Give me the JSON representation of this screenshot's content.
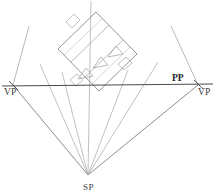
{
  "diagram": {
    "type": "perspective-construction",
    "canvas": {
      "width": 215,
      "height": 196
    },
    "background_color": "#ffffff"
  },
  "labels": {
    "vp_left": "VP",
    "vp_right": "VP",
    "picture_plane": "PP",
    "station_point": "SP",
    "caption": ""
  },
  "colors": {
    "picture_plane_line": "#4a4a4a",
    "sight_line": "#6e6e6e",
    "construction_line": "#9a9a9a",
    "object_outline": "#8a8a8a",
    "object_detail": "#a9a9a9",
    "label_text": "#2b2b2b"
  },
  "points": {
    "vp_left": {
      "x": 13,
      "y": 85
    },
    "vp_right": {
      "x": 198,
      "y": 85
    },
    "station_point": {
      "x": 88,
      "y": 175
    },
    "pp_line": {
      "x1": 2,
      "y1": 86,
      "x2": 213,
      "y2": 84
    }
  },
  "geometry": {
    "picture_plane": {
      "x1": 2,
      "y1": 86,
      "x2": 213,
      "y2": 84
    },
    "vp_rays": [
      {
        "name": "vp-left-to-sp",
        "x1": 13,
        "y1": 85,
        "x2": 88,
        "y2": 175
      },
      {
        "name": "vp-right-to-sp",
        "x1": 198,
        "y1": 85,
        "x2": 88,
        "y2": 175
      },
      {
        "name": "vp-left-upper",
        "x1": 13,
        "y1": 85,
        "x2": 28,
        "y2": 28
      },
      {
        "name": "vp-right-upper",
        "x1": 198,
        "y1": 85,
        "x2": 172,
        "y2": 28
      }
    ],
    "sight_lines": [
      {
        "name": "sight-line-center",
        "x1": 88,
        "y1": 175,
        "x2": 90,
        "y2": 2
      },
      {
        "name": "sight-line-left-a",
        "x1": 88,
        "y1": 175,
        "x2": 46,
        "y2": 80
      },
      {
        "name": "sight-line-left-b",
        "x1": 88,
        "y1": 175,
        "x2": 60,
        "y2": 82
      },
      {
        "name": "sight-line-right-a",
        "x1": 88,
        "y1": 175,
        "x2": 134,
        "y2": 82
      },
      {
        "name": "sight-line-right-b",
        "x1": 88,
        "y1": 175,
        "x2": 156,
        "y2": 80
      }
    ],
    "object_plan": {
      "name": "rotated-rectangular-plan",
      "rotation_deg": -38,
      "corners": [
        {
          "x": 58,
          "y": 49
        },
        {
          "x": 96,
          "y": 12
        },
        {
          "x": 137,
          "y": 54
        },
        {
          "x": 99,
          "y": 91
        }
      ],
      "inner_divisions": [
        {
          "x1": 71,
          "y1": 62,
          "x2": 109,
          "y2": 25
        },
        {
          "x1": 84,
          "y1": 76,
          "x2": 122,
          "y2": 39
        }
      ],
      "markers": [
        {
          "name": "plan-marker-1",
          "x": 84,
          "y": 72
        },
        {
          "name": "plan-marker-2",
          "x": 101,
          "y": 62
        },
        {
          "name": "plan-marker-3",
          "x": 116,
          "y": 50
        }
      ],
      "tabs": [
        {
          "name": "plan-tab-top",
          "x1": 68,
          "y1": 18,
          "x2": 80,
          "y2": 26
        },
        {
          "name": "plan-tab-bottom",
          "x1": 72,
          "y1": 78,
          "x2": 84,
          "y2": 87
        },
        {
          "name": "plan-tab-right",
          "x1": 120,
          "y1": 62,
          "x2": 133,
          "y2": 70
        }
      ]
    }
  }
}
